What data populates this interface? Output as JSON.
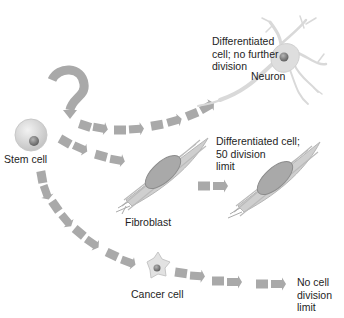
{
  "diagram": {
    "type": "stem cell differentiation pathways",
    "colors": {
      "background": "#ffffff",
      "arrow": "#a9a9a9",
      "cell_fill": "#dcdcdc",
      "nucleus": "#8a8a8a",
      "text": "#1e1e1e"
    },
    "nodes": {
      "stem_cell": {
        "label": "Stem cell"
      },
      "neuron": {
        "label": "Neuron",
        "description": "Differentiated\ncell; no further\ndivision"
      },
      "fibroblast": {
        "label": "Fibroblast"
      },
      "fibroblast_2": {
        "description": "Differentiated cell;\n50 division\nlimit"
      },
      "cancer_cell": {
        "label": "Cancer cell",
        "description": "No cell\ndivision\nlimit"
      }
    },
    "edges": [
      {
        "from": "stem_cell",
        "to": "stem_cell",
        "kind": "self-renewal loop"
      },
      {
        "from": "stem_cell",
        "to": "neuron"
      },
      {
        "from": "stem_cell",
        "to": "fibroblast"
      },
      {
        "from": "fibroblast",
        "to": "fibroblast_2"
      },
      {
        "from": "stem_cell",
        "to": "cancer_cell"
      },
      {
        "from": "cancer_cell",
        "to": "no_limit"
      }
    ]
  }
}
